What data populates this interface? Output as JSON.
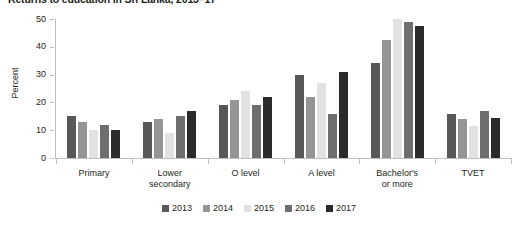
{
  "chart_data": {
    "type": "bar",
    "title": "Returns to education in Sri Lanka, 2013–17",
    "xlabel": "",
    "ylabel": "Percent",
    "ylim": [
      0,
      50
    ],
    "yticks": [
      0,
      10,
      20,
      30,
      40,
      50
    ],
    "grid": false,
    "legend_position": "bottom",
    "categories": [
      "Primary",
      "Lower\nsecondary",
      "O level",
      "A level",
      "Bachelor's\nor more",
      "TVET"
    ],
    "category_labels": [
      {
        "line1": "Primary",
        "line2": ""
      },
      {
        "line1": "Lower",
        "line2": "secondary"
      },
      {
        "line1": "O level",
        "line2": ""
      },
      {
        "line1": "A level",
        "line2": ""
      },
      {
        "line1": "Bachelor's",
        "line2": "or more"
      },
      {
        "line1": "TVET",
        "line2": ""
      }
    ],
    "series": [
      {
        "name": "2013",
        "color": "#58585a",
        "values": [
          15,
          13,
          19,
          30,
          34,
          16
        ]
      },
      {
        "name": "2014",
        "color": "#959597",
        "values": [
          13,
          14,
          21,
          22,
          42.5,
          14
        ]
      },
      {
        "name": "2015",
        "color": "#e2e2e2",
        "values": [
          10,
          9,
          24,
          27,
          50,
          11.5
        ]
      },
      {
        "name": "2016",
        "color": "#6e6e70",
        "values": [
          12,
          15,
          19,
          16,
          49,
          17
        ]
      },
      {
        "name": "2017",
        "color": "#2b2b2d",
        "values": [
          10.2,
          17,
          22,
          31,
          47.5,
          14.5
        ]
      }
    ]
  },
  "axis": {
    "y_tick_labels": [
      "50",
      "40",
      "30",
      "20",
      "10",
      "0"
    ],
    "y_title": "Percent"
  },
  "legend": {
    "items": [
      {
        "label": "2013",
        "color": "#58585a"
      },
      {
        "label": "2014",
        "color": "#959597"
      },
      {
        "label": "2015",
        "color": "#e2e2e2"
      },
      {
        "label": "2016",
        "color": "#6e6e70"
      },
      {
        "label": "2017",
        "color": "#2b2b2d"
      }
    ]
  }
}
